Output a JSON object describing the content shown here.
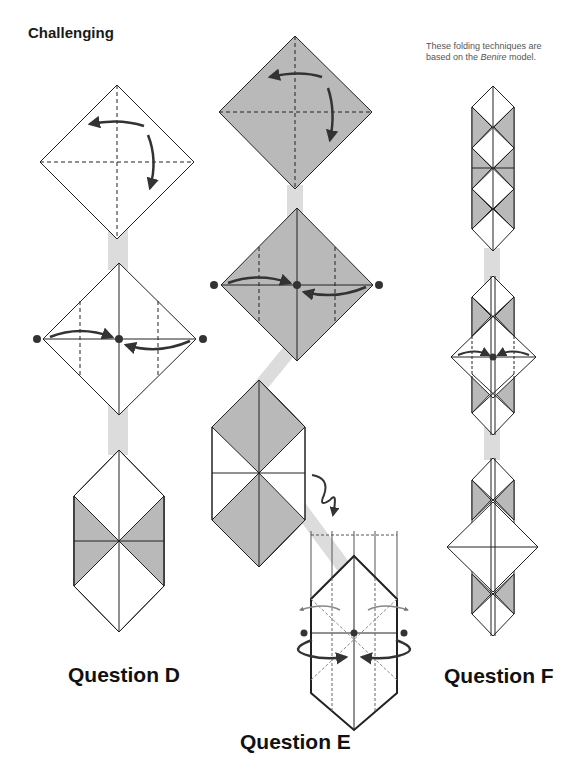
{
  "heading": "Challenging",
  "note": {
    "line1": "These folding techniques are",
    "line2_prefix": "based on the ",
    "model_name": "Benire",
    "line2_suffix": " model."
  },
  "questions": [
    {
      "id": "D",
      "label": "Question D",
      "steps": 3
    },
    {
      "id": "E",
      "label": "Question E",
      "steps": 4
    },
    {
      "id": "F",
      "label": "Question F",
      "steps": 3
    }
  ],
  "colors": {
    "paper_grey": "#b9b9b9",
    "paper_white": "#ffffff",
    "line": "#222222",
    "connector": "#dcdcdc",
    "arrow": "#333333"
  }
}
